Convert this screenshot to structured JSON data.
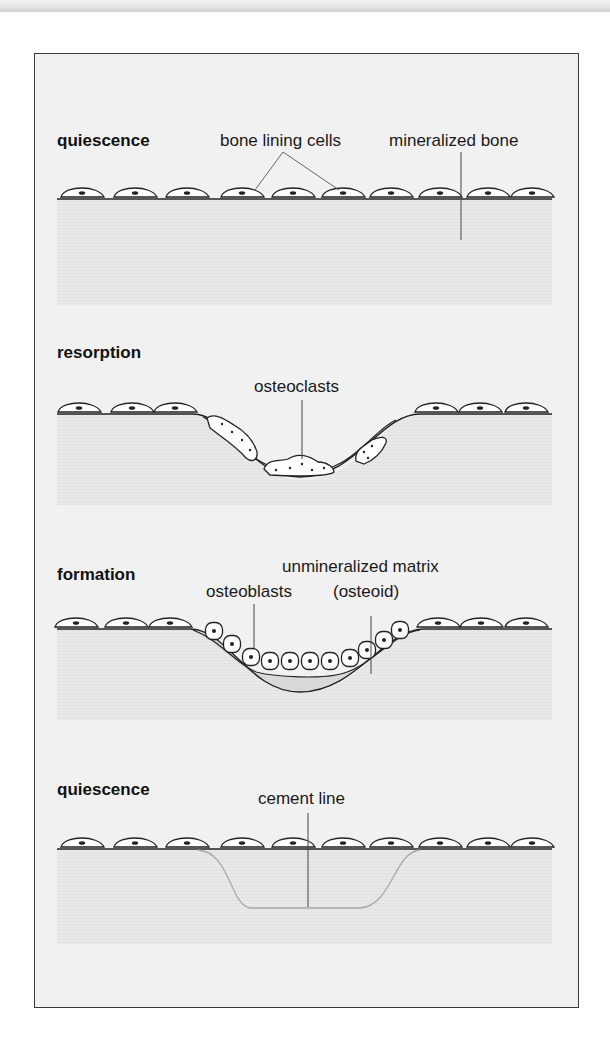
{
  "figure": {
    "type": "bone remodeling cycle diagram",
    "colors": {
      "panel_background": "#f1f1f1",
      "bone_region": "#e9e9e9",
      "outline": "#222222",
      "cell_fill": "#ffffff",
      "osteoid_fill": "#d9d9d9",
      "cement_line": "#a8a8a8"
    }
  },
  "stages": [
    {
      "title": "quiescence",
      "labels": {
        "cells": "bone lining cells",
        "bone": "mineralized bone"
      }
    },
    {
      "title": "resorption",
      "labels": {
        "cells": "osteoclasts"
      }
    },
    {
      "title": "formation",
      "labels": {
        "cells": "osteoblasts",
        "matrix_line1": "unmineralized matrix",
        "matrix_line2": "(osteoid)"
      }
    },
    {
      "title": "quiescence",
      "labels": {
        "line": "cement line"
      }
    }
  ]
}
